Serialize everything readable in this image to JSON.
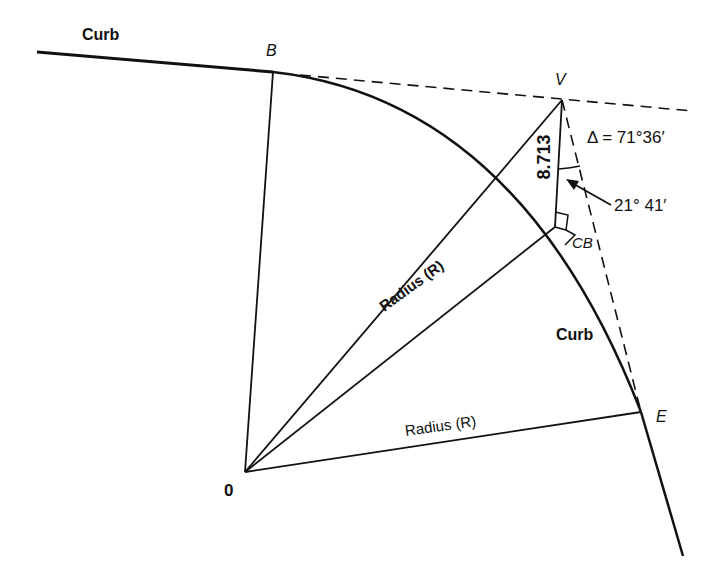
{
  "diagram": {
    "type": "curb-return geometry",
    "colors": {
      "ink": "#111111",
      "background": "#ffffff"
    },
    "points": {
      "O": {
        "label": "0",
        "x": 245,
        "y": 472
      },
      "B": {
        "label": "B",
        "x": 273,
        "y": 72
      },
      "V": {
        "label": "V",
        "x": 562,
        "y": 100
      },
      "CB": {
        "label": "CB",
        "x": 555,
        "y": 227
      },
      "E": {
        "label": "E",
        "x": 641,
        "y": 412
      }
    },
    "labels": {
      "curb_top": "Curb",
      "curb_right": "Curb",
      "radius_diagonal": "Radius (R)",
      "radius_bottom": "Radius (R)",
      "distance": "8.713",
      "delta_angle": "Δ = 71°36′",
      "half_angle": "21° 41′",
      "point_b": "B",
      "point_v": "V",
      "point_cb": "CB",
      "point_e": "E",
      "point_o": "0"
    },
    "measurements": {
      "external_distance": 8.713,
      "deflection_angle": "71°36′",
      "angle_at_v": "21° 41′"
    }
  }
}
